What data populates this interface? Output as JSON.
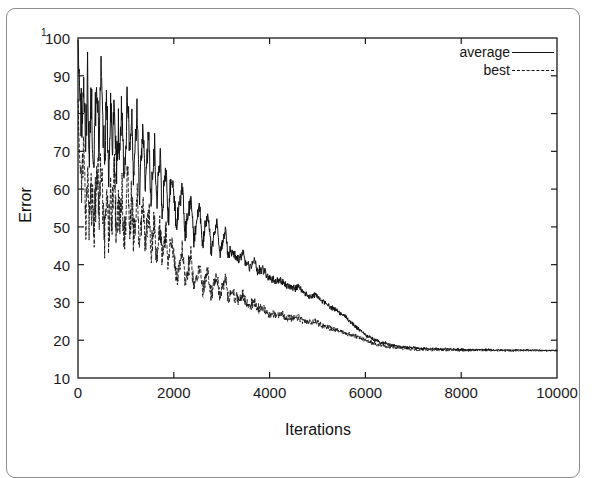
{
  "figure": {
    "frame_color": "#8d8d8d",
    "background": "#ffffff",
    "superscript_artifact": "1"
  },
  "chart_data": {
    "type": "line",
    "title": "",
    "xlabel": "Iterations",
    "ylabel": "Error",
    "xlim": [
      0,
      10000
    ],
    "ylim": [
      10,
      100
    ],
    "grid": false,
    "legend_position": "top-right",
    "xticks": [
      0,
      2000,
      4000,
      6000,
      8000,
      10000
    ],
    "xtick_labels": [
      "0",
      "2000",
      "4000",
      "6000",
      "8000",
      "10000"
    ],
    "yticks": [
      10,
      20,
      30,
      40,
      50,
      60,
      70,
      80,
      90,
      100
    ],
    "ytick_labels": [
      "10",
      "20",
      "30",
      "40",
      "50",
      "60",
      "70",
      "80",
      "90",
      "100"
    ],
    "series": [
      {
        "name": "average",
        "style": "solid",
        "color": "#111111",
        "x": [
          0,
          40,
          80,
          120,
          160,
          200,
          240,
          280,
          320,
          360,
          400,
          440,
          480,
          520,
          560,
          600,
          640,
          680,
          720,
          760,
          800,
          840,
          880,
          920,
          960,
          1000,
          1040,
          1080,
          1120,
          1160,
          1200,
          1240,
          1280,
          1320,
          1360,
          1400,
          1440,
          1480,
          1520,
          1560,
          1600,
          1640,
          1680,
          1720,
          1760,
          1800,
          1840,
          1880,
          1920,
          1960,
          2000,
          2060,
          2120,
          2180,
          2240,
          2300,
          2360,
          2420,
          2480,
          2540,
          2600,
          2660,
          2720,
          2780,
          2840,
          2900,
          2960,
          3020,
          3080,
          3140,
          3200,
          3280,
          3360,
          3440,
          3520,
          3600,
          3680,
          3760,
          3840,
          3920,
          4000,
          4120,
          4240,
          4360,
          4480,
          4600,
          4720,
          4840,
          4960,
          5080,
          5200,
          5320,
          5440,
          5560,
          5680,
          5800,
          6000,
          6200,
          6400,
          6600,
          6800,
          7000,
          7300,
          7600,
          7900,
          8200,
          8500,
          8800,
          9100,
          9400,
          9700,
          10000
        ],
        "y": [
          97.5,
          84.0,
          78.5,
          88.0,
          74.0,
          86.5,
          70.0,
          82.0,
          66.0,
          79.0,
          87.0,
          72.0,
          90.0,
          76.0,
          68.0,
          84.0,
          62.0,
          80.0,
          71.0,
          86.0,
          64.0,
          77.0,
          69.0,
          83.0,
          60.0,
          75.0,
          85.0,
          67.0,
          78.0,
          63.0,
          73.0,
          81.0,
          58.0,
          70.0,
          76.0,
          61.0,
          68.0,
          74.0,
          57.0,
          66.0,
          71.0,
          55.0,
          64.0,
          69.0,
          53.0,
          62.0,
          66.0,
          51.0,
          60.0,
          64.0,
          58.0,
          50.0,
          56.0,
          61.0,
          48.0,
          54.0,
          58.0,
          47.0,
          52.0,
          56.0,
          45.0,
          50.0,
          53.0,
          44.0,
          48.0,
          51.0,
          43.0,
          46.0,
          49.0,
          42.0,
          44.0,
          42.0,
          41.0,
          43.0,
          40.0,
          39.5,
          41.0,
          38.0,
          39.0,
          37.5,
          36.5,
          35.5,
          36.0,
          34.5,
          33.5,
          34.0,
          32.5,
          31.5,
          32.0,
          30.5,
          29.5,
          28.5,
          27.5,
          26.5,
          25.0,
          23.5,
          21.5,
          20.0,
          19.2,
          18.6,
          18.2,
          18.0,
          17.8,
          17.7,
          17.6,
          17.5,
          17.5,
          17.4,
          17.4,
          17.4,
          17.3,
          17.3
        ]
      },
      {
        "name": "best",
        "style": "dashed",
        "color": "#111111",
        "x": [
          0,
          40,
          80,
          120,
          160,
          200,
          240,
          280,
          320,
          360,
          400,
          440,
          480,
          520,
          560,
          600,
          640,
          680,
          720,
          760,
          800,
          840,
          880,
          920,
          960,
          1000,
          1040,
          1080,
          1120,
          1160,
          1200,
          1240,
          1280,
          1320,
          1360,
          1400,
          1440,
          1480,
          1520,
          1560,
          1600,
          1640,
          1680,
          1720,
          1760,
          1800,
          1840,
          1880,
          1920,
          1960,
          2000,
          2060,
          2120,
          2180,
          2240,
          2300,
          2360,
          2420,
          2480,
          2540,
          2600,
          2660,
          2720,
          2780,
          2840,
          2900,
          2960,
          3020,
          3080,
          3140,
          3200,
          3280,
          3360,
          3440,
          3520,
          3600,
          3680,
          3760,
          3840,
          3920,
          4000,
          4120,
          4240,
          4360,
          4480,
          4600,
          4720,
          4840,
          4960,
          5080,
          5200,
          5320,
          5440,
          5560,
          5680,
          5800,
          6000,
          6200,
          6400,
          6600,
          6800,
          7000,
          7300,
          7600,
          7900,
          8200,
          8500,
          8800,
          9100,
          9400,
          9700,
          10000
        ],
        "y": [
          82.0,
          66.0,
          58.0,
          70.0,
          54.0,
          64.0,
          50.0,
          61.0,
          47.0,
          58.0,
          66.0,
          52.0,
          68.0,
          55.0,
          49.0,
          63.0,
          46.0,
          60.0,
          51.0,
          65.0,
          47.0,
          57.0,
          50.0,
          62.0,
          45.0,
          55.0,
          64.0,
          48.0,
          58.0,
          46.0,
          53.0,
          60.0,
          43.0,
          51.0,
          56.0,
          45.0,
          50.0,
          54.0,
          42.0,
          48.0,
          52.0,
          41.0,
          47.0,
          50.0,
          40.0,
          45.0,
          48.0,
          39.0,
          44.0,
          47.0,
          42.0,
          37.0,
          40.0,
          44.0,
          35.0,
          39.0,
          42.0,
          34.0,
          37.0,
          40.0,
          33.0,
          36.0,
          38.0,
          32.0,
          35.0,
          37.0,
          31.5,
          34.0,
          36.0,
          31.0,
          33.0,
          31.5,
          30.5,
          32.0,
          29.5,
          29.0,
          30.5,
          28.0,
          29.0,
          27.5,
          27.0,
          26.5,
          27.0,
          26.0,
          25.5,
          26.0,
          25.0,
          24.5,
          25.0,
          24.0,
          23.5,
          23.0,
          22.5,
          22.0,
          21.5,
          21.0,
          20.0,
          19.0,
          18.4,
          18.0,
          17.8,
          17.6,
          17.5,
          17.4,
          17.4,
          17.3,
          17.3,
          17.3,
          17.2,
          17.2,
          17.2,
          17.2
        ]
      }
    ]
  },
  "legend": {
    "items": [
      {
        "label": "average",
        "style": "solid"
      },
      {
        "label": "best",
        "style": "dashed"
      }
    ]
  }
}
